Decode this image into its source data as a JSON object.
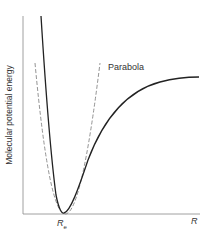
{
  "diagram": {
    "ylabel": "Molecular potential energy",
    "xlabel": "R",
    "min_label": "R",
    "min_label_sub": "e",
    "curve_label": "Parabola",
    "colors": {
      "curve": "#222222",
      "parabola": "#777777",
      "axis": "#888888"
    }
  }
}
